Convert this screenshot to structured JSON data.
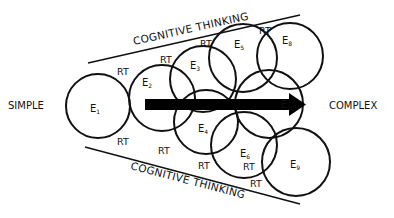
{
  "diagram": {
    "left_label": "SIMPLE",
    "right_label": "COMPLEX",
    "top_band_label": "COGNITIVE THINKING",
    "bottom_band_label": "COGNITIVE THINKING",
    "connector_label": "RT",
    "circles": [
      {
        "id": "E1",
        "letter": "E",
        "sub": "1",
        "cx": 98,
        "cy": 106,
        "r": 32
      },
      {
        "id": "E2",
        "letter": "E",
        "sub": "2",
        "cx": 162,
        "cy": 98,
        "r": 33
      },
      {
        "id": "E3",
        "letter": "E",
        "sub": "3",
        "cx": 203,
        "cy": 79,
        "r": 33
      },
      {
        "id": "E4",
        "letter": "E",
        "sub": "4",
        "cx": 206,
        "cy": 122,
        "r": 32
      },
      {
        "id": "E5",
        "letter": "E",
        "sub": "5",
        "cx": 243,
        "cy": 58,
        "r": 34
      },
      {
        "id": "E6",
        "letter": "E",
        "sub": "6",
        "cx": 244,
        "cy": 145,
        "r": 33
      },
      {
        "id": "E7",
        "letter": "E",
        "sub": "7",
        "cx": 269,
        "cy": 104,
        "r": 34
      },
      {
        "id": "E8",
        "letter": "E",
        "sub": "8",
        "cx": 290,
        "cy": 56,
        "r": 33
      },
      {
        "id": "E9",
        "letter": "E",
        "sub": "9",
        "cx": 296,
        "cy": 162,
        "r": 34
      }
    ],
    "rt_positions": [
      {
        "x": 117,
        "y": 75
      },
      {
        "x": 160,
        "y": 63
      },
      {
        "x": 200,
        "y": 47
      },
      {
        "x": 259,
        "y": 34
      },
      {
        "x": 117,
        "y": 145
      },
      {
        "x": 158,
        "y": 154
      },
      {
        "x": 198,
        "y": 169
      },
      {
        "x": 243,
        "y": 170
      },
      {
        "x": 250,
        "y": 187
      }
    ],
    "arrow": {
      "from_x": 145,
      "to_x": 305,
      "y": 104,
      "color": "#000000"
    },
    "line_color": "#111111"
  }
}
